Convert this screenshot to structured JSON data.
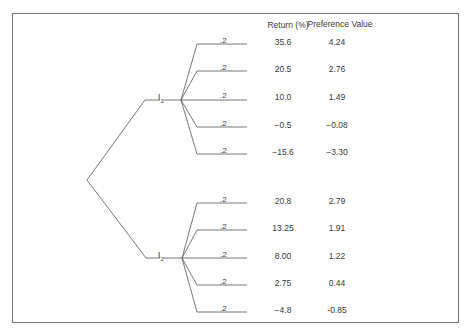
{
  "diagram": {
    "type": "decision-tree",
    "headers": {
      "return": "Return (%)",
      "preference": "Preference Value"
    },
    "branches": [
      {
        "label": "I",
        "subscript": "1",
        "outcomes": [
          {
            "probability": ".2",
            "return": "35.6",
            "preference": "4.24"
          },
          {
            "probability": ".2",
            "return": "20.5",
            "preference": "2.76"
          },
          {
            "probability": ".2",
            "return": "10.0",
            "preference": "1.49"
          },
          {
            "probability": ".2",
            "return": "−0.5",
            "preference": "−0.08"
          },
          {
            "probability": ".2",
            "return": "−15.6",
            "preference": "−3.30"
          }
        ]
      },
      {
        "label": "I",
        "subscript": "2",
        "outcomes": [
          {
            "probability": ".2",
            "return": "20.8",
            "preference": "2.79"
          },
          {
            "probability": ".2",
            "return": "13.25",
            "preference": "1.91"
          },
          {
            "probability": ".2",
            "return": "8.00",
            "preference": "1.22"
          },
          {
            "probability": ".2",
            "return": "2.75",
            "preference": "0.44"
          },
          {
            "probability": ".2",
            "return": "−4.8",
            "preference": "-0.85"
          }
        ]
      }
    ],
    "colors": {
      "line": "#555555",
      "text": "#3a3a3a",
      "frame": "#777777"
    }
  }
}
